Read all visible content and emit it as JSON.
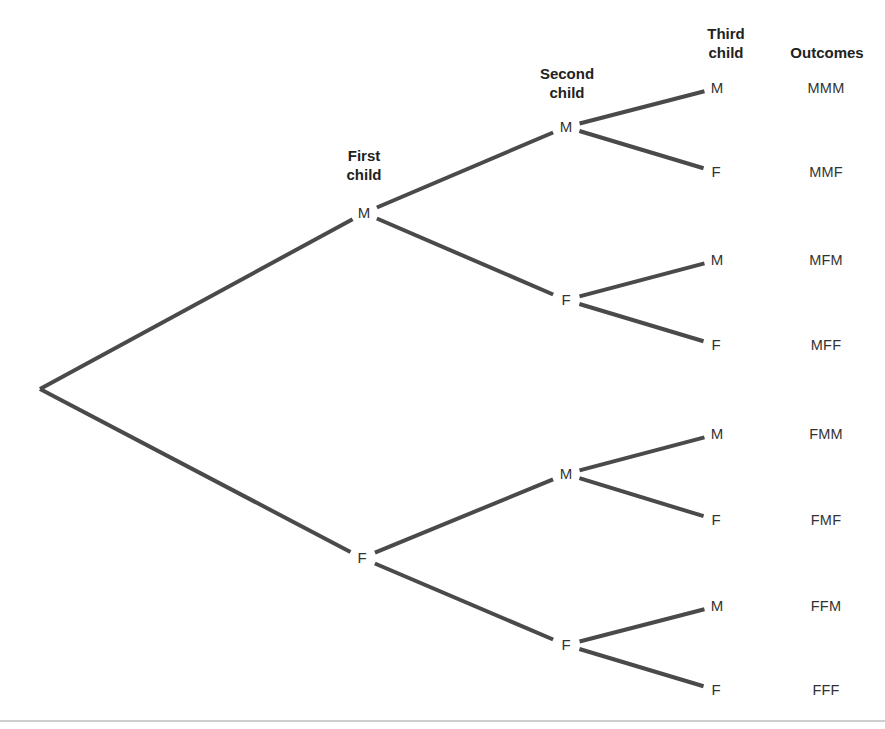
{
  "diagram": {
    "type": "probability-tree",
    "headers": {
      "first": [
        "First",
        "child"
      ],
      "second": [
        "Second",
        "child"
      ],
      "third": [
        "Third",
        "child"
      ],
      "outcomes": "Outcomes"
    },
    "style": {
      "line_color": "#4a4a4a",
      "rule_color": "#cfcfcf"
    },
    "root": {
      "x": 40,
      "y": 389
    },
    "level1": [
      {
        "label": "M",
        "x": 364,
        "y": 213
      },
      {
        "label": "F",
        "x": 362,
        "y": 558
      }
    ],
    "level2": [
      {
        "label": "M",
        "x": 566,
        "y": 127,
        "parent": 0
      },
      {
        "label": "F",
        "x": 566,
        "y": 300,
        "parent": 0
      },
      {
        "label": "M",
        "x": 566,
        "y": 474,
        "parent": 1
      },
      {
        "label": "F",
        "x": 566,
        "y": 645,
        "parent": 1
      }
    ],
    "level3": [
      {
        "label": "M",
        "x": 717,
        "y": 88,
        "parent": 0
      },
      {
        "label": "F",
        "x": 716,
        "y": 172,
        "parent": 0
      },
      {
        "label": "M",
        "x": 717,
        "y": 260,
        "parent": 1
      },
      {
        "label": "F",
        "x": 716,
        "y": 345,
        "parent": 1
      },
      {
        "label": "M",
        "x": 717,
        "y": 434,
        "parent": 2
      },
      {
        "label": "F",
        "x": 716,
        "y": 520,
        "parent": 2
      },
      {
        "label": "M",
        "x": 717,
        "y": 606,
        "parent": 3
      },
      {
        "label": "F",
        "x": 716,
        "y": 690,
        "parent": 3
      }
    ],
    "outcomes": [
      "MMM",
      "MMF",
      "MFM",
      "MFF",
      "FMM",
      "FMF",
      "FFM",
      "FFF"
    ]
  }
}
